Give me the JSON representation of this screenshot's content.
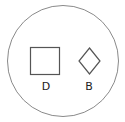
{
  "diagram": {
    "container": {
      "shape": "circle",
      "stroke": "#8a8a8a"
    },
    "items": [
      {
        "shape": "square",
        "label": "D",
        "stroke": "#555555"
      },
      {
        "shape": "diamond",
        "label": "B",
        "stroke": "#555555"
      }
    ]
  }
}
